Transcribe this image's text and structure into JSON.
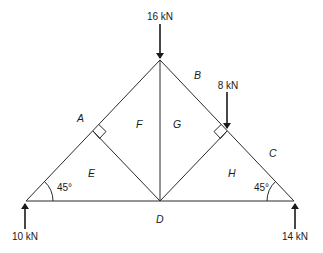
{
  "diagram": {
    "type": "roof-truss-bows-notation",
    "loads": [
      {
        "id": "apex-load",
        "label": "16 kN",
        "direction": "down"
      },
      {
        "id": "right-rafter-load",
        "label": "8 kN",
        "direction": "down"
      },
      {
        "id": "left-reaction",
        "label": "10 kN",
        "direction": "up"
      },
      {
        "id": "right-reaction",
        "label": "14 kN",
        "direction": "up"
      }
    ],
    "angles": {
      "left": "45°",
      "right": "45°"
    },
    "regions": {
      "A": "A",
      "B": "B",
      "C": "C",
      "D": "D",
      "E": "E",
      "F": "F",
      "G": "G",
      "H": "H"
    },
    "colors": {
      "line": "#2a2a2a",
      "text": "#1a1a1a",
      "background": "#ffffff"
    }
  }
}
